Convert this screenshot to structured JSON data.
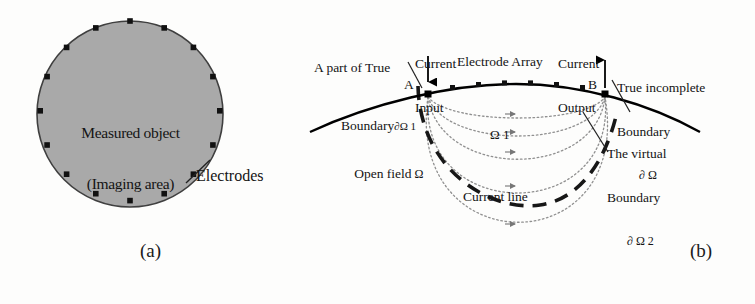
{
  "figure": {
    "domain": "scientific-diagram",
    "panels": [
      {
        "caption": "(a)",
        "title": "Measured object with circular electrode array",
        "circle": {
          "fill_color": "#a9a9a9",
          "stroke_color": "#3a3a3a",
          "inner_label_line1": "Measured object",
          "inner_label_line2": "(Imaging area)",
          "electrode_count": 16,
          "electrode_color": "#1a1a1a"
        },
        "callout": {
          "label": "Electrodes"
        }
      },
      {
        "caption": "(b)",
        "title": "Open field model with incomplete boundary",
        "labels": {
          "true_boundary_part_line1": "A part of True",
          "true_boundary_part_line2": "Boundary",
          "true_boundary_part_symbol": "∂Ω 1",
          "current_input_line1": "Current",
          "current_input_line2": "Input",
          "electrode_array": "Electrode Array",
          "current_output_line1": "Current",
          "current_output_line2": "Output",
          "true_incomplete_line1": "True incomplete",
          "true_incomplete_line2": "Boundary",
          "true_incomplete_symbol": "∂ Ω",
          "virtual_boundary_line1": "The virtual",
          "virtual_boundary_line2": "Boundary",
          "virtual_boundary_symbol": "∂ Ω 2",
          "open_field": "Open field",
          "open_field_symbol": "Ω",
          "region_omega1": "Ω 1",
          "current_line": "Current line",
          "point_a": "A",
          "point_b": "B"
        },
        "geometry": {
          "electrode_array_count": 7,
          "current_line_count": 5,
          "boundary_color": "#000000",
          "virtual_boundary_color": "#1a1a1a",
          "current_line_color": "#8a8a8a"
        }
      }
    ]
  }
}
